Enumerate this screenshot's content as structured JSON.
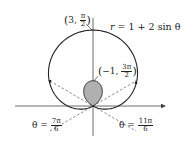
{
  "chart_data": {
    "type": "polar_curve",
    "equation": "r = 1 + 2 sin θ",
    "equation_label": {
      "lhs": "r",
      "rhs": "= 1 + 2 sin θ"
    },
    "points": [
      {
        "label": "(3, π/2)",
        "r": 3,
        "theta": "π/2",
        "r_text": "3",
        "theta_num": "π",
        "theta_den": "2"
      },
      {
        "label": "(−1, 3π/2)",
        "r": -1,
        "theta": "3π/2",
        "r_text": "−1",
        "theta_num": "3π",
        "theta_den": "2"
      }
    ],
    "rays": [
      {
        "label": "θ = 7π/6",
        "var": "θ =",
        "num": "7π",
        "den": "6"
      },
      {
        "label": "θ = 11π/6",
        "var": "θ =",
        "num": "11π",
        "den": "6"
      }
    ],
    "inner_loop_shaded": true,
    "axes": {
      "x_arrow": true,
      "y_arrow": false
    }
  },
  "colors": {
    "curve": "#222222",
    "shade": "#b0b0b0",
    "axes": "#444444",
    "dash": "#555555"
  }
}
